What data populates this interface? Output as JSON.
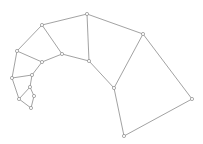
{
  "diagram": {
    "type": "planar-graph",
    "colors": {
      "edge": "#8a8a8a",
      "node_fill": "#ffffff",
      "node_stroke": "#8a8a8a"
    },
    "node_radius": 1.6,
    "nodes": [
      {
        "id": "A",
        "x": 87,
        "y": 14
      },
      {
        "id": "B",
        "x": 42,
        "y": 25
      },
      {
        "id": "C",
        "x": 143,
        "y": 34
      },
      {
        "id": "D",
        "x": 17,
        "y": 51
      },
      {
        "id": "E",
        "x": 62,
        "y": 54
      },
      {
        "id": "F",
        "x": 42,
        "y": 62
      },
      {
        "id": "G",
        "x": 89,
        "y": 61
      },
      {
        "id": "H",
        "x": 32,
        "y": 75
      },
      {
        "id": "I",
        "x": 12,
        "y": 78
      },
      {
        "id": "J",
        "x": 114,
        "y": 88
      },
      {
        "id": "K",
        "x": 30,
        "y": 87
      },
      {
        "id": "L",
        "x": 34,
        "y": 96
      },
      {
        "id": "M",
        "x": 19,
        "y": 99
      },
      {
        "id": "N",
        "x": 192,
        "y": 99
      },
      {
        "id": "O",
        "x": 31,
        "y": 108
      },
      {
        "id": "P",
        "x": 124,
        "y": 136
      }
    ],
    "edges": [
      [
        "A",
        "B"
      ],
      [
        "A",
        "C"
      ],
      [
        "A",
        "G"
      ],
      [
        "B",
        "D"
      ],
      [
        "B",
        "E"
      ],
      [
        "C",
        "J"
      ],
      [
        "C",
        "N"
      ],
      [
        "D",
        "F"
      ],
      [
        "D",
        "I"
      ],
      [
        "E",
        "F"
      ],
      [
        "E",
        "G"
      ],
      [
        "G",
        "J"
      ],
      [
        "J",
        "P"
      ],
      [
        "N",
        "P"
      ],
      [
        "F",
        "H"
      ],
      [
        "H",
        "I"
      ],
      [
        "H",
        "K"
      ],
      [
        "I",
        "M"
      ],
      [
        "K",
        "M"
      ],
      [
        "K",
        "L"
      ],
      [
        "L",
        "O"
      ],
      [
        "M",
        "O"
      ]
    ]
  }
}
